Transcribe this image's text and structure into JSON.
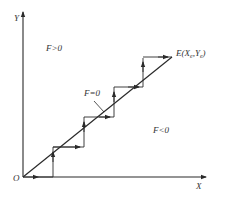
{
  "diagram": {
    "type": "linear-interpolation-staircase",
    "axes": {
      "x_label": "X",
      "y_label": "Y",
      "origin_label": "O"
    },
    "regions": {
      "above": "F>0",
      "on_line": "F=0",
      "below": "F<0"
    },
    "endpoint_label": "E(Xe,Ye)",
    "endpoint": {
      "name": "E",
      "x_sub": "e",
      "y_sub": "e"
    },
    "colors": {
      "line": "#2a2a2a",
      "background": "#ffffff",
      "text": "#333333"
    },
    "staircase_steps": 4
  }
}
